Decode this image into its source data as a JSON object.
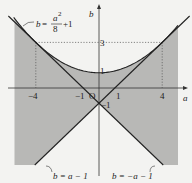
{
  "diagram": {
    "type": "region-plot",
    "axes": {
      "x_label": "a",
      "y_label": "b",
      "origin_label": "O",
      "x_ticks": [
        {
          "value": -4,
          "label": "−4"
        },
        {
          "value": -1,
          "label": "−1"
        },
        {
          "value": 1,
          "label": "1"
        },
        {
          "value": 4,
          "label": "4"
        }
      ],
      "y_ticks": [
        {
          "value": 3,
          "label": "3"
        },
        {
          "value": 1,
          "label": "1"
        },
        {
          "value": -1,
          "label": "−1"
        }
      ]
    },
    "curves": [
      {
        "id": "parabola",
        "label_lhs": "b",
        "label_eq": "=",
        "label_num": "a",
        "label_exp": "2",
        "label_den": "8",
        "label_rest": "+1",
        "formula": "b = a^2/8 + 1"
      },
      {
        "id": "line-pos",
        "label": "b = a − 1",
        "formula": "b = a - 1"
      },
      {
        "id": "line-neg",
        "label": "b = −a − 1",
        "formula": "b = -a - 1"
      }
    ],
    "region": "shaded area between the parabola and the two lines (above lines, below parabola), plus beyond",
    "guide_points": [
      {
        "a": -4,
        "b": 3
      },
      {
        "a": 4,
        "b": 3
      }
    ],
    "colors": {
      "background": "#f3f3f1",
      "shade": "#b8b8b6",
      "curve": "#222222",
      "dotted": "#555555"
    }
  }
}
